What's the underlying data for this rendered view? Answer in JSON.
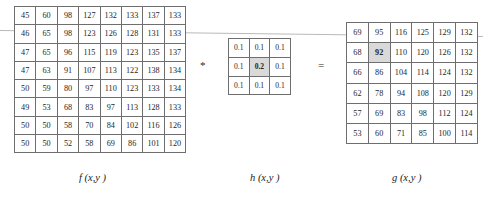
{
  "figure": {
    "operators": {
      "convolve": "*",
      "equals": "="
    },
    "captions": {
      "input": "f (x,y )",
      "kernel": "h (x,y )",
      "output": "g (x,y )"
    }
  },
  "chart_data": {
    "type": "table",
    "matrices": [
      {
        "name": "f",
        "label": "f (x,y )",
        "rows": 8,
        "cols": 8,
        "highlight_row": 1,
        "values": [
          [
            45,
            60,
            98,
            127,
            132,
            133,
            137,
            133
          ],
          [
            46,
            65,
            98,
            123,
            126,
            128,
            131,
            133
          ],
          [
            47,
            65,
            96,
            115,
            119,
            123,
            135,
            137
          ],
          [
            47,
            63,
            91,
            107,
            113,
            122,
            138,
            134
          ],
          [
            50,
            59,
            80,
            97,
            110,
            123,
            133,
            134
          ],
          [
            49,
            53,
            68,
            83,
            97,
            113,
            128,
            133
          ],
          [
            50,
            50,
            58,
            70,
            84,
            102,
            116,
            126
          ],
          [
            50,
            50,
            52,
            58,
            69,
            86,
            101,
            120
          ]
        ]
      },
      {
        "name": "h",
        "label": "h (x,y )",
        "rows": 3,
        "cols": 3,
        "highlight_cell": [
          1,
          1
        ],
        "values": [
          [
            "0.1",
            "0.1",
            "0.1"
          ],
          [
            "0.1",
            "0.2",
            "0.1"
          ],
          [
            "0.1",
            "0.1",
            "0.1"
          ]
        ]
      },
      {
        "name": "g",
        "label": "g (x,y )",
        "rows": 6,
        "cols": 6,
        "highlight_cell": [
          1,
          1
        ],
        "values": [
          [
            69,
            95,
            116,
            125,
            129,
            132
          ],
          [
            68,
            92,
            110,
            120,
            126,
            132
          ],
          [
            66,
            86,
            104,
            114,
            124,
            132
          ],
          [
            62,
            78,
            94,
            108,
            120,
            129
          ],
          [
            57,
            69,
            83,
            98,
            112,
            124
          ],
          [
            53,
            60,
            71,
            85,
            100,
            114
          ]
        ]
      }
    ]
  }
}
